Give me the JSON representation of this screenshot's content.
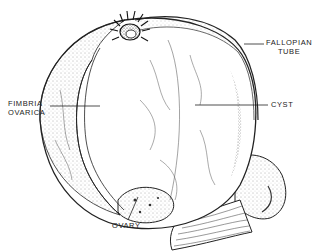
{
  "diagram": {
    "labels": {
      "fallopian_tube": [
        "FALLOPIAN",
        "TUBE"
      ],
      "fimbria_ovarica": [
        "FIMBRIA",
        "OVARICA"
      ],
      "cyst": "CYST",
      "ovary": "OVARY"
    },
    "colors": {
      "ink": "#222222",
      "background": "#ffffff",
      "shade": "#9a9a9a"
    }
  }
}
